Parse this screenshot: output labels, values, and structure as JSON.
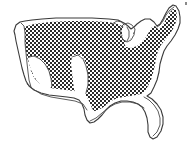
{
  "figure": {
    "title": "Contiguous United States outline map",
    "subject": "United States",
    "region_name": "Contiguous United States (Lower 48)",
    "projection_note": "simplified national outline",
    "background_color": "#ffffff",
    "outline_color": "#3a3a3a",
    "pattern_color": "#2b2b2b",
    "pattern_name": "checkerboard-halftone",
    "pattern_cell_px": 2,
    "style": "monochrome line drawing with patterned interior fill",
    "canvas": {
      "width": 195,
      "height": 143
    }
  },
  "legend_note": {
    "shaded_meaning": "shaded / patterned area",
    "unshaded_meaning": "unshaded white area"
  },
  "regions": [
    {
      "id": "shaded-interior",
      "name": "Shaded interior region",
      "fill": "checkerboard-halftone",
      "covers": "northern plains, midwest, great lakes states, northeast, appalachia, southeast, eastern texas"
    },
    {
      "id": "pacific-coast-strip",
      "name": "Pacific coast strip",
      "fill": "none",
      "covers": "western california, oregon, washington coastline"
    },
    {
      "id": "southwest-void",
      "name": "Southwest unshaded area",
      "fill": "none",
      "covers": "southern california, arizona, nevada, new mexico"
    },
    {
      "id": "west-texas-void",
      "name": "West Texas unshaded area",
      "fill": "none",
      "covers": "western texas"
    },
    {
      "id": "florida-void",
      "name": "Florida peninsula unshaded area",
      "fill": "none",
      "covers": "florida peninsula"
    },
    {
      "id": "great-lakes-void",
      "name": "Great Lakes unshaded area",
      "fill": "none",
      "covers": "lake michigan, lake superior, lake huron, lake erie"
    }
  ],
  "features": [
    {
      "id": "maine-northeast",
      "name": "Northeast / Maine projection"
    },
    {
      "id": "great-lakes",
      "name": "Great Lakes notch"
    },
    {
      "id": "florida-peninsula",
      "name": "Florida peninsula"
    },
    {
      "id": "gulf-coast",
      "name": "Gulf Coast"
    },
    {
      "id": "texas-gulf",
      "name": "Texas Gulf coast"
    },
    {
      "id": "pacific-coast",
      "name": "Pacific coast"
    },
    {
      "id": "canadian-border",
      "name": "Northern / Canadian border"
    },
    {
      "id": "baja-notch",
      "name": "Southern California notch"
    }
  ]
}
